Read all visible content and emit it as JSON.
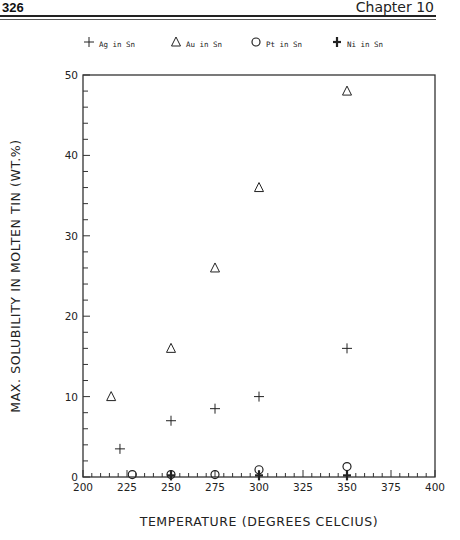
{
  "page": {
    "number": "326",
    "chapter": "Chapter 10"
  },
  "legend": {
    "items": [
      {
        "marker": "plus-thin",
        "label": "Ag in Sn"
      },
      {
        "marker": "triangle",
        "label": "Au in Sn"
      },
      {
        "marker": "circle",
        "label": "Pt in Sn"
      },
      {
        "marker": "plus-bold",
        "label": "Ni in Sn"
      }
    ]
  },
  "axes": {
    "xlabel": "TEMPERATURE (DEGREES CELCIUS)",
    "ylabel": "MAX. SOLUBILITY IN MOLTEN TIN (WT.%)",
    "xticks": [
      "200",
      "225",
      "250",
      "275",
      "300",
      "325",
      "350",
      "375",
      "400"
    ],
    "yticks": [
      "0",
      "10",
      "20",
      "30",
      "40",
      "50"
    ]
  },
  "chart_data": {
    "type": "scatter",
    "title": "",
    "xlabel": "TEMPERATURE (DEGREES CELCIUS)",
    "ylabel": "MAX. SOLUBILITY IN MOLTEN TIN (WT.%)",
    "xlim": [
      200,
      400
    ],
    "ylim": [
      0,
      50
    ],
    "x_ticks": [
      200,
      225,
      250,
      275,
      300,
      325,
      350,
      375,
      400
    ],
    "y_ticks": [
      0,
      10,
      20,
      30,
      40,
      50
    ],
    "x_minor_step": 5,
    "y_minor_step": 2,
    "grid": false,
    "legend_position": "top",
    "series": [
      {
        "name": "Ag in Sn",
        "marker": "plus-thin",
        "points": [
          [
            221,
            3.5
          ],
          [
            250,
            7
          ],
          [
            275,
            8.5
          ],
          [
            300,
            10
          ],
          [
            350,
            16
          ]
        ]
      },
      {
        "name": "Au in Sn",
        "marker": "triangle",
        "points": [
          [
            216,
            10
          ],
          [
            250,
            16
          ],
          [
            275,
            26
          ],
          [
            300,
            36
          ],
          [
            350,
            48
          ]
        ]
      },
      {
        "name": "Pt in Sn",
        "marker": "circle",
        "points": [
          [
            228,
            0.3
          ],
          [
            250,
            0.3
          ],
          [
            275,
            0.3
          ],
          [
            300,
            0.9
          ],
          [
            350,
            1.3
          ]
        ]
      },
      {
        "name": "Ni in Sn",
        "marker": "plus-bold",
        "points": [
          [
            250,
            0.2
          ],
          [
            300,
            0.2
          ],
          [
            350,
            0.2
          ]
        ]
      }
    ]
  }
}
